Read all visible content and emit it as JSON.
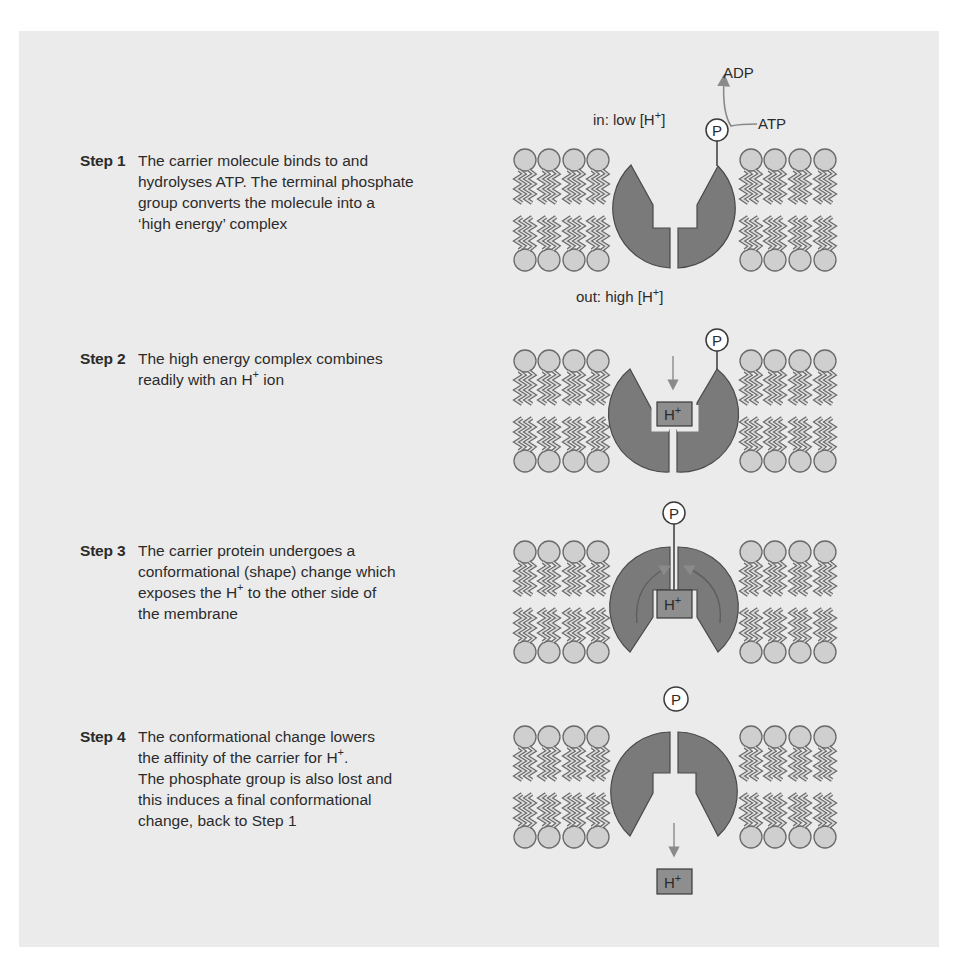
{
  "figure": {
    "background_color": "#ebebeb",
    "protein_color": "#7a7a7a",
    "lipid_head_color": "#cfcfcf",
    "arrow_color": "#8a8a8a",
    "labels": {
      "inside": "in: low [H",
      "outside": "out: high [H",
      "superscript_plus": "+",
      "close_bracket": "]",
      "adp": "ADP",
      "atp": "ATP",
      "phosphate": "P",
      "proton": "H",
      "proton_sup": "+"
    }
  },
  "steps": [
    {
      "label": "Step 1",
      "text_lines": [
        "The carrier molecule binds to and",
        "hydrolyses ATP.  The terminal phosphate",
        "group converts the molecule into a",
        "‘high energy’ complex"
      ]
    },
    {
      "label": "Step 2",
      "text_parts": [
        "The high energy complex combines",
        "readily with an H",
        "+",
        " ion"
      ]
    },
    {
      "label": "Step 3",
      "text_parts": [
        "The carrier protein undergoes a",
        "conformational (shape) change which",
        "exposes the H",
        "+",
        " to the other side of",
        "the membrane"
      ]
    },
    {
      "label": "Step 4",
      "text_parts": [
        "The conformational change lowers",
        "the affinity of the carrier for H",
        "+",
        ".",
        "The phosphate group is also lost and",
        "this induces a final conformational",
        "change, back to Step 1"
      ]
    }
  ]
}
